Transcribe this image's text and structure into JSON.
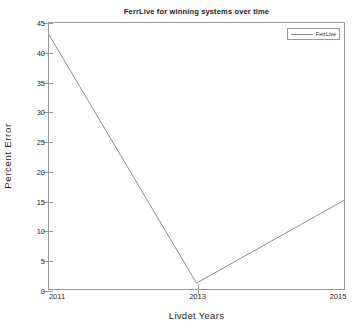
{
  "chart_data": {
    "type": "line",
    "title": "FerrLive for winning systems over time",
    "xlabel": "Livdet Years",
    "ylabel": "Percent  Error",
    "x": [
      2011,
      2013,
      2015
    ],
    "xticks": [
      "2011",
      "2013",
      "2015"
    ],
    "xlim": [
      2011,
      2015
    ],
    "series": [
      {
        "name": "FerrLive",
        "values": [
          43,
          1,
          15
        ],
        "color": "#8c8c8c"
      }
    ],
    "yticks": [
      "0",
      "5",
      "10",
      "15",
      "20",
      "25",
      "30",
      "35",
      "40",
      "45"
    ],
    "ylim": [
      0,
      45
    ],
    "grid": false,
    "legend_position": "top-right",
    "legend_entries": [
      "FerrLive"
    ]
  },
  "figure": {
    "background_color": "#ffffff",
    "axis_color": "#9a9a9a",
    "text_color": "#1f1f1f"
  }
}
